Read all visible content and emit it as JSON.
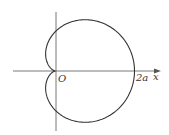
{
  "figure": {
    "type": "cardioid",
    "equation": "r = a(1 + cos θ)",
    "labels": {
      "origin": "O",
      "intercept": "2a",
      "x_axis": "x"
    },
    "colors": {
      "curve": "#333333",
      "axes": "#555555",
      "background": "#ffffff"
    }
  }
}
